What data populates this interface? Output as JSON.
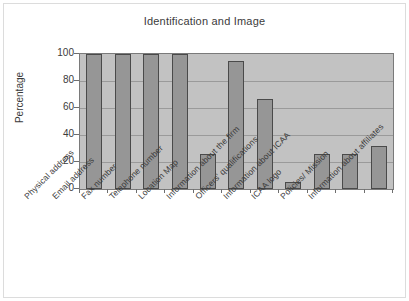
{
  "chart_data": {
    "type": "bar",
    "title": "Identification and Image",
    "xlabel": "",
    "ylabel": "Percentage",
    "ylim": [
      0,
      100
    ],
    "yticks": [
      "0",
      "20",
      "40",
      "60",
      "80",
      "100"
    ],
    "grid": true,
    "legend": "none",
    "categories": [
      "Physical address",
      "Email address",
      "Fax number",
      "Telephone number",
      "Location Map",
      "Information about the firm",
      "Officers' qualifications",
      "Information about ICAA",
      "ICAA logo",
      "Policies/ Mission",
      "Information about affiliates"
    ],
    "values": [
      100,
      100,
      100,
      100,
      26,
      95,
      67,
      5,
      26,
      26,
      32
    ],
    "colors": {
      "bar_fill": "#969696",
      "bar_border": "#4a4a4a",
      "plot_background": "#c2c2c2",
      "gridline": "#9a9a9a",
      "axis": "#7a7a7a",
      "text": "#3b3b3b",
      "page_background": "#ffffff"
    }
  }
}
